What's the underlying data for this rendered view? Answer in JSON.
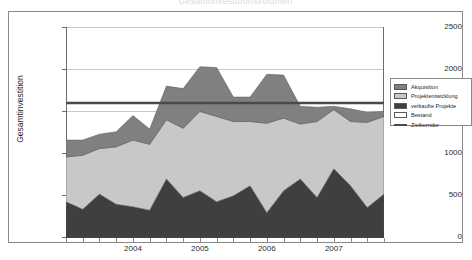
{
  "chart_title": "Gesamtinvestitionsvolumen",
  "axes": {
    "ylabel": "Gesamtinvestition",
    "xlabel": "",
    "yticks": [
      0,
      500,
      1000,
      1500,
      2000,
      2500
    ],
    "ylim": [
      0,
      2500
    ],
    "xticks_labeled": [
      "2004",
      "2005",
      "2006",
      "2007"
    ],
    "grid": true
  },
  "legend": {
    "position": "right",
    "items": [
      {
        "label": "Akquisition",
        "color": "#808080",
        "type": "area"
      },
      {
        "label": "Projektentwicklung",
        "color": "#c8c8c8",
        "type": "area"
      },
      {
        "label": "verkaufte Projekte",
        "color": "#3f3f3f",
        "type": "area"
      },
      {
        "label": "Bestand",
        "color": "#ffffff",
        "type": "area"
      },
      {
        "label": "Zielkorridor",
        "color": "#4a4a4a",
        "type": "line"
      }
    ]
  },
  "chart_data": {
    "type": "area",
    "title": "Gesamtinvestitionsvolumen",
    "xlabel": "",
    "ylabel": "Gesamtinvestition",
    "ylim": [
      0,
      2500
    ],
    "grid": true,
    "stacked": true,
    "x": [
      "2003-Q3",
      "2003-Q4",
      "2004-Q1",
      "2004-Q2",
      "2004-Q3",
      "2004-Q4",
      "2005-Q1",
      "2005-Q2",
      "2005-Q3",
      "2005-Q4",
      "2006-Q1",
      "2006-Q2",
      "2006-Q3",
      "2006-Q4",
      "2007-Q1",
      "2007-Q2",
      "2007-Q3",
      "2007-Q4",
      "2008-Q1",
      "2008-Q2"
    ],
    "x_tick_positions": {
      "2004": 4,
      "2005": 8,
      "2006": 12,
      "2007": 16
    },
    "series": [
      {
        "name": "verkaufte Projekte",
        "color": "#3f3f3f",
        "values": [
          430,
          340,
          520,
          400,
          370,
          330,
          700,
          480,
          560,
          430,
          500,
          620,
          300,
          560,
          700,
          480,
          820,
          620,
          360,
          520
        ]
      },
      {
        "name": "Projektentwicklung",
        "color": "#c8c8c8",
        "values": [
          530,
          640,
          540,
          680,
          790,
          780,
          700,
          820,
          940,
          1010,
          880,
          760,
          1060,
          860,
          650,
          900,
          700,
          760,
          1010,
          920
        ]
      },
      {
        "name": "Akquisition",
        "color": "#808080",
        "values": [
          200,
          180,
          170,
          180,
          290,
          180,
          400,
          470,
          530,
          580,
          290,
          290,
          580,
          510,
          210,
          170,
          40,
          150,
          120,
          60
        ]
      }
    ],
    "reference_lines": [
      {
        "name": "Zielkorridor",
        "value": 1600,
        "color": "#4a4a4a"
      }
    ]
  }
}
